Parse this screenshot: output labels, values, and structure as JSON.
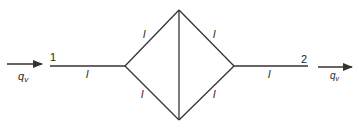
{
  "diagram": {
    "type": "pipe-network",
    "stroke_color": "#333333",
    "inlet": {
      "node_label": "1",
      "flow_label": "q",
      "flow_subscript": "v"
    },
    "outlet": {
      "node_label": "2",
      "flow_label": "q",
      "flow_subscript": "v"
    },
    "segment_label": "l",
    "segments": [
      {
        "id": "inlet-pipe",
        "label": "l"
      },
      {
        "id": "upper-left-pipe",
        "label": "l"
      },
      {
        "id": "lower-left-pipe",
        "label": "l"
      },
      {
        "id": "upper-right-pipe",
        "label": "l"
      },
      {
        "id": "lower-right-pipe",
        "label": "l"
      },
      {
        "id": "outlet-pipe",
        "label": "l"
      }
    ]
  }
}
